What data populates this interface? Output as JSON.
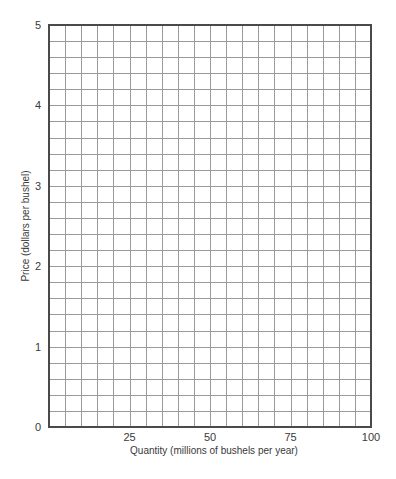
{
  "chart_data": {
    "type": "line",
    "title": "",
    "xlabel": "Quantity (millions of bushels per year)",
    "ylabel": "Price (dollars per bushel)",
    "xlim": [
      0,
      100
    ],
    "ylim": [
      0,
      5
    ],
    "x_ticks": [
      25,
      50,
      75,
      100
    ],
    "x_tick_labels": [
      "25",
      "50",
      "75",
      "100"
    ],
    "y_ticks": [
      0,
      1,
      2,
      3,
      4,
      5
    ],
    "y_tick_labels": [
      "0",
      "1",
      "2",
      "3",
      "4",
      "5"
    ],
    "grid": true,
    "grid_x_step": 5,
    "grid_y_step": 0.2,
    "series": [],
    "legend": null
  },
  "layout": {
    "plot_left": 49,
    "plot_top": 25,
    "plot_right": 371,
    "plot_bottom": 427
  },
  "colors": {
    "grid": "#9a9a9a",
    "frame": "#4a4a4a",
    "text": "#3a3a3a",
    "background": "#ffffff"
  }
}
